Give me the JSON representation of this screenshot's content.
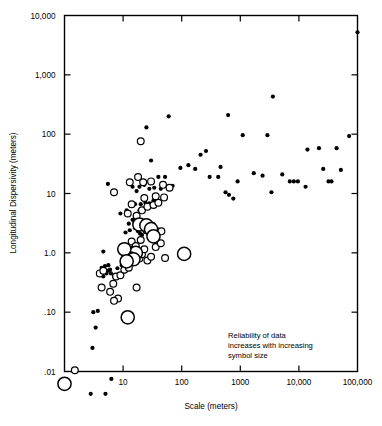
{
  "chart_data": {
    "type": "scatter",
    "title": "",
    "xlabel": "Scale (meters)",
    "ylabel": "Longitudinal Dispersivity (meters)",
    "xscale": "log",
    "yscale": "log",
    "xlim": [
      1,
      100000
    ],
    "ylim": [
      0.01,
      10000
    ],
    "grid": false,
    "legend_position": "inside-lower-right",
    "annotation": {
      "line1": "Reliability of data",
      "line2": "increases with increasing",
      "line3": "symbol size"
    },
    "xticks": [
      1,
      10,
      100,
      1000,
      10000,
      100000
    ],
    "xtick_labels": [
      "1",
      "10",
      "100",
      "1000",
      "10,000",
      "100,000"
    ],
    "yticks": [
      0.01,
      0.1,
      1.0,
      10,
      100,
      1000,
      10000
    ],
    "ytick_labels": [
      ".01",
      ".10",
      "1.0",
      "10",
      "100",
      "1,000",
      "10,000"
    ],
    "symbol_legend": [
      {
        "name": "low-reliability",
        "style": "small-filled-dot",
        "size_px": 2.1
      },
      {
        "name": "medium-reliability",
        "style": "medium-open-circle",
        "size_px": 3.4
      },
      {
        "name": "high-reliability",
        "style": "large-open-circle",
        "size_px": 6.6
      }
    ],
    "series": [
      {
        "name": "low-reliability",
        "style": "filled",
        "radius": 2.1,
        "points": [
          [
            2.8,
            0.0042
          ],
          [
            5.0,
            0.0042
          ],
          [
            6.3,
            0.0075
          ],
          [
            3.0,
            0.025
          ],
          [
            3.4,
            0.055
          ],
          [
            3.1,
            0.1
          ],
          [
            3.7,
            0.105
          ],
          [
            4.6,
            0.4
          ],
          [
            5.2,
            0.45
          ],
          [
            6.2,
            0.45
          ],
          [
            5.6,
            0.5
          ],
          [
            6.0,
            0.52
          ],
          [
            7.0,
            0.4
          ],
          [
            8.0,
            0.55
          ],
          [
            9.5,
            0.62
          ],
          [
            4.3,
            0.56
          ],
          [
            4.9,
            0.6
          ],
          [
            5.6,
            0.62
          ],
          [
            4.6,
            1.05
          ],
          [
            10.5,
            1.05
          ],
          [
            9.5,
            1.35
          ],
          [
            11.0,
            2.2
          ],
          [
            13.0,
            2.4
          ],
          [
            16.0,
            2.6
          ],
          [
            18.0,
            2.3
          ],
          [
            19.5,
            2.1
          ],
          [
            21.0,
            2.0
          ],
          [
            12.5,
            3.1
          ],
          [
            14.5,
            3.6
          ],
          [
            16.0,
            4.3
          ],
          [
            9.0,
            4.6
          ],
          [
            11.5,
            5.2
          ],
          [
            19.0,
            5.2
          ],
          [
            23.0,
            5.6
          ],
          [
            13.5,
            6.6
          ],
          [
            16.0,
            6.6
          ],
          [
            20.0,
            6.6
          ],
          [
            24.0,
            7.0
          ],
          [
            28.0,
            6.8
          ],
          [
            33.0,
            7.6
          ],
          [
            5.5,
            14.5
          ],
          [
            14.5,
            13.0
          ],
          [
            17.0,
            11.0
          ],
          [
            19.0,
            13.0
          ],
          [
            23.0,
            14.0
          ],
          [
            28.0,
            12.0
          ],
          [
            34.0,
            12.5
          ],
          [
            44.0,
            12.0
          ],
          [
            70.0,
            13.5
          ],
          [
            30.0,
            36.0
          ],
          [
            40.0,
            19.0
          ],
          [
            52.0,
            19.0
          ],
          [
            25.0,
            130.0
          ],
          [
            60.0,
            200.0
          ],
          [
            95.0,
            27.0
          ],
          [
            130.0,
            30.0
          ],
          [
            170.0,
            26.0
          ],
          [
            210.0,
            45.0
          ],
          [
            260.0,
            52.0
          ],
          [
            300.0,
            19.0
          ],
          [
            420.0,
            19.0
          ],
          [
            460.0,
            28.0
          ],
          [
            560.0,
            10.5
          ],
          [
            640.0,
            9.5
          ],
          [
            760.0,
            8.2
          ],
          [
            900.0,
            16.0
          ],
          [
            620.0,
            210.0
          ],
          [
            1100.0,
            96.0
          ],
          [
            1700.0,
            22.0
          ],
          [
            2400.0,
            20.0
          ],
          [
            2900.0,
            96.0
          ],
          [
            3400.0,
            10.5
          ],
          [
            3600.0,
            430.0
          ],
          [
            5200.0,
            21.0
          ],
          [
            7000.0,
            16.0
          ],
          [
            8200.0,
            16.0
          ],
          [
            9600.0,
            16.0
          ],
          [
            13000.0,
            13.0
          ],
          [
            14000.0,
            55.0
          ],
          [
            22000.0,
            58.0
          ],
          [
            26000.0,
            26.0
          ],
          [
            32000.0,
            16.0
          ],
          [
            36000.0,
            16.0
          ],
          [
            44000.0,
            58.0
          ],
          [
            52000.0,
            25.0
          ],
          [
            72000.0,
            93.0
          ],
          [
            100000.0,
            5200.0
          ]
        ]
      },
      {
        "name": "medium-reliability",
        "style": "open",
        "radius": 3.4,
        "points": [
          [
            1.5,
            0.0105
          ],
          [
            4.3,
            0.26
          ],
          [
            4.0,
            0.45
          ],
          [
            4.6,
            0.5
          ],
          [
            6.0,
            0.22
          ],
          [
            6.8,
            0.3
          ],
          [
            7.6,
            0.4
          ],
          [
            9.0,
            0.42
          ],
          [
            8.2,
            0.17
          ],
          [
            7.0,
            0.155
          ],
          [
            10.5,
            0.52
          ],
          [
            12.5,
            0.56
          ],
          [
            13.5,
            0.73
          ],
          [
            15.5,
            0.78
          ],
          [
            19.0,
            0.8
          ],
          [
            21.0,
            0.95
          ],
          [
            23.0,
            1.15
          ],
          [
            26.0,
            0.74
          ],
          [
            30.0,
            0.86
          ],
          [
            36.0,
            1.25
          ],
          [
            44.0,
            1.45
          ],
          [
            52.0,
            0.82
          ],
          [
            17.0,
            0.26
          ],
          [
            20.0,
            1.65
          ],
          [
            25.0,
            2.4
          ],
          [
            31.0,
            2.9
          ],
          [
            38.0,
            2.3
          ],
          [
            45.0,
            2.3
          ],
          [
            14.0,
            1.55
          ],
          [
            16.5,
            1.3
          ],
          [
            12.0,
            4.6
          ],
          [
            17.0,
            4.2
          ],
          [
            21.0,
            5.2
          ],
          [
            14.0,
            6.6
          ],
          [
            26.0,
            6.0
          ],
          [
            33.0,
            6.4
          ],
          [
            40.0,
            7.0
          ],
          [
            23.0,
            8.4
          ],
          [
            36.0,
            9.0
          ],
          [
            50.0,
            8.6
          ],
          [
            18.0,
            19.0
          ],
          [
            22.0,
            15.5
          ],
          [
            30.0,
            16.0
          ],
          [
            48.0,
            14.0
          ],
          [
            62.0,
            12.5
          ],
          [
            7.0,
            10.5
          ],
          [
            20.0,
            76.0
          ],
          [
            13.0,
            15.5
          ]
        ]
      },
      {
        "name": "high-reliability",
        "style": "open",
        "radius": 6.6,
        "points": [
          [
            1.0,
            0.0062
          ],
          [
            12.0,
            0.082
          ],
          [
            12.5,
            1.0
          ],
          [
            16.5,
            1.0
          ],
          [
            13.5,
            0.8
          ],
          [
            15.0,
            0.78
          ],
          [
            110.0,
            0.96
          ],
          [
            19.0,
            3.0
          ],
          [
            25.0,
            2.9
          ],
          [
            30.0,
            2.5
          ],
          [
            33.0,
            1.9
          ],
          [
            10.5,
            1.15
          ],
          [
            11.5,
            0.72
          ]
        ]
      }
    ]
  },
  "axis": {
    "xlabel": "Scale (meters)",
    "ylabel": "Longitudinal Dispersivity (meters)"
  }
}
